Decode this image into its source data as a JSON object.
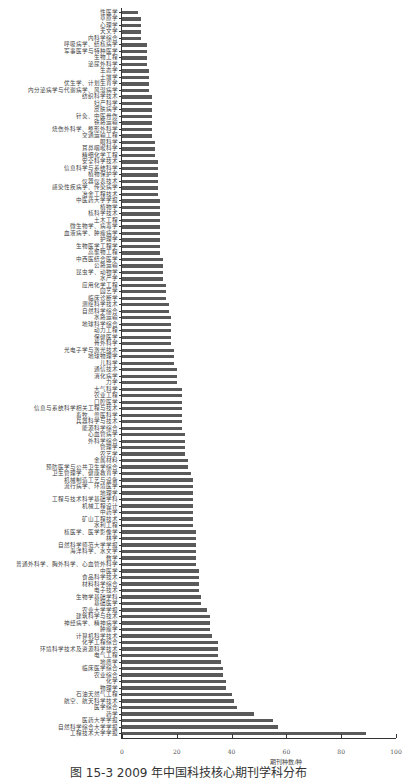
{
  "chart_data": {
    "type": "bar",
    "orientation": "horizontal",
    "title": "",
    "xlabel": "期刊种数/种",
    "ylabel": "",
    "xlim": [
      0,
      100
    ],
    "xticks": [
      0,
      20,
      40,
      60,
      80,
      100
    ],
    "grid": false,
    "legend": null,
    "categories": [
      "性医学",
      "草原学",
      "心理学",
      "天文学",
      "内科学综合",
      "呼吸病学、结核病学",
      "军事医学与特种医学",
      "生物工程",
      "泌尿外科学",
      "生态学",
      "土壤学",
      "优生学、计划生育学",
      "内分泌病学与代谢病学、风湿病学",
      "纺织科学技术",
      "妇产科学",
      "皮肤病学",
      "针灸、中医骨伤",
      "铁路运输",
      "烧伤外科学、整形外科学",
      "交通运输工程",
      "眼科学",
      "耳鼻咽喉科学",
      "精细化学工程",
      "安全科学技术",
      "信息科学与系统科学",
      "植物保护学",
      "仪器仪表技术",
      "感染性疾病学、传染病学",
      "冶金工程技术",
      "中医药大学学报",
      "植物学",
      "核科学技术",
      "土木工程",
      "微生物学、病毒学",
      "血液病学、肿瘤病学",
      "护理学",
      "生物医学工程学",
      "高聚物工程",
      "中西医结合医学",
      "公路运输",
      "昆虫学、动物学",
      "水产学",
      "应用化学工程",
      "园艺学",
      "临床诊断学",
      "测绘科学技术",
      "自然科学综合",
      "水路运输",
      "地球科学综合",
      "动力工程",
      "保健医学",
      "骨外科学",
      "光电子学与激光技术",
      "地球物理学",
      "儿科学",
      "通信技术",
      "消化病学",
      "力学",
      "大气科学",
      "农业工程",
      "口腔医学",
      "信息与系统科学相关工程与技术",
      "畜牧、兽医科学",
      "兵器科学与技术",
      "能源科学综合",
      "心血管病学",
      "外科学综合",
      "管理学",
      "农艺学",
      "金属材料",
      "预防医学与公共卫生学综合",
      "卫生管理学、健康教育学",
      "机械制造工艺与设备",
      "流行病学、环境医学",
      "地理学",
      "工程与技术科学基础学科",
      "机械工程设计",
      "中药学",
      "矿山工程技术",
      "水利工程",
      "核医学、医学影像学",
      "林学",
      "自然科学师范大学学报",
      "海洋科学、水文学",
      "数学",
      "普通外科学、胸外科学、心血管外科学",
      "中医学",
      "食品科学技术",
      "材料科学综合",
      "电子技术",
      "生物学基础学科",
      "基础医学",
      "农业大学学报",
      "建筑科学与技术",
      "神经病学、精神病学",
      "肿瘤学",
      "计算机科学技术",
      "化学工程综合",
      "环境科学技术及资源科学技术",
      "电气工程",
      "地质学",
      "临床医学综合",
      "农业综合",
      "化学",
      "物理学",
      "石油天然气工程",
      "航空、航天科学技术",
      "医学综合",
      "药学",
      "医药大学学报",
      "自然科学综合大学学报",
      "工程技术大学学报"
    ],
    "values": [
      6,
      7,
      7,
      7,
      7,
      9,
      9,
      9,
      9,
      10,
      10,
      10,
      10,
      11,
      11,
      11,
      11,
      11,
      11,
      11,
      12,
      12,
      12,
      13,
      13,
      13,
      13,
      13,
      13,
      14,
      14,
      14,
      14,
      14,
      14,
      14,
      14,
      14,
      15,
      15,
      15,
      15,
      16,
      16,
      16,
      17,
      17,
      18,
      18,
      18,
      18,
      18,
      19,
      19,
      19,
      20,
      20,
      20,
      22,
      22,
      22,
      22,
      22,
      22,
      22,
      23,
      23,
      23,
      23,
      24,
      24,
      25,
      26,
      26,
      26,
      26,
      26,
      26,
      26,
      26,
      27,
      27,
      27,
      27,
      27,
      27,
      28,
      28,
      28,
      28,
      29,
      29,
      31,
      32,
      32,
      32,
      33,
      35,
      35,
      35,
      36,
      37,
      37,
      38,
      38,
      40,
      41,
      42,
      48,
      55,
      57,
      89
    ]
  },
  "caption": "图 15-3  2009 年中国科技核心期刊学科分布"
}
